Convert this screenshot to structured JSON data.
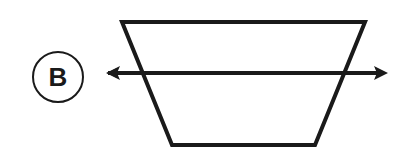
{
  "diagram": {
    "label": "B",
    "stroke_color": "#1a1a1a",
    "background": "#ffffff",
    "shape": "inverted-trapezoid",
    "trapezoid": {
      "top_left": [
        122,
        22
      ],
      "top_right": [
        365,
        22
      ],
      "bottom_right": [
        315,
        145
      ],
      "bottom_left": [
        172,
        145
      ]
    },
    "axis_arrow": {
      "y": 73,
      "x_start": 106,
      "x_end": 386,
      "direction": "bidirectional"
    },
    "label_circle": {
      "cx": 58,
      "cy": 77,
      "r": 25
    }
  }
}
